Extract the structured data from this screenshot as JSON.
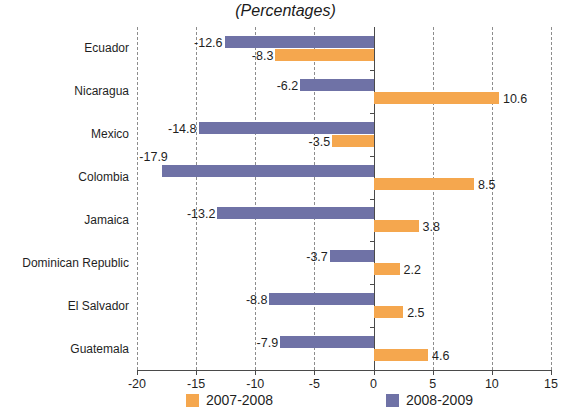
{
  "chart_data": {
    "type": "bar",
    "orientation": "horizontal",
    "title": "",
    "subtitle": "(Percentages)",
    "xlabel": "",
    "ylabel": "",
    "xlim": [
      -20,
      15
    ],
    "xticks": [
      -20,
      -15,
      -10,
      -5,
      0,
      5,
      10,
      15
    ],
    "xtick_labels": [
      "-20",
      "-15",
      "-10",
      "-5",
      "0",
      "5",
      "10",
      "15"
    ],
    "grid": true,
    "grid_style": "dashed-vertical",
    "legend_position": "bottom",
    "categories": [
      "Ecuador",
      "Nicaragua",
      "Mexico",
      "Colombia",
      "Jamaica",
      "Dominican Republic",
      "El Salvador",
      "Guatemala"
    ],
    "series": [
      {
        "name": "2007-2008",
        "color": "#f5a74e",
        "values": [
          -8.3,
          10.6,
          -3.5,
          8.5,
          3.8,
          2.2,
          2.5,
          4.6
        ],
        "value_labels": [
          "-8.3",
          "10.6",
          "-3.5",
          "8.5",
          "3.8",
          "2.2",
          "2.5",
          "4.6"
        ]
      },
      {
        "name": "2008-2009",
        "color": "#6f72a6",
        "values": [
          -12.6,
          -6.2,
          -14.8,
          -17.9,
          -13.2,
          -3.7,
          -8.8,
          -7.9
        ],
        "value_labels": [
          "-12.6",
          "-6.2",
          "-14.8",
          "-17.9",
          "-13.2",
          "-3.7",
          "-8.8",
          "-7.9"
        ]
      }
    ]
  },
  "legend": {
    "items": [
      {
        "label": "2007-2008",
        "color": "#f5a74e"
      },
      {
        "label": "2008-2009",
        "color": "#6f72a6"
      }
    ]
  }
}
